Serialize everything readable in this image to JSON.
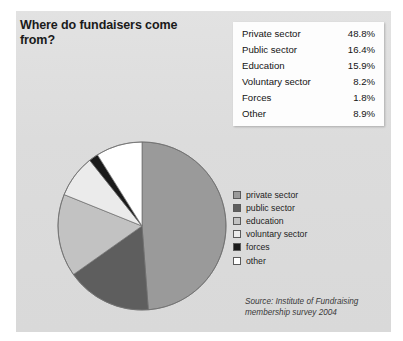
{
  "panel": {
    "background_color": "#dedede"
  },
  "title": "Where do fundaisers come from?",
  "table": {
    "rows": [
      {
        "label": "Private sector",
        "value": "48.8%"
      },
      {
        "label": "Public sector",
        "value": "16.4%"
      },
      {
        "label": "Education",
        "value": "15.9%"
      },
      {
        "label": "Voluntary sector",
        "value": "8.2%"
      },
      {
        "label": "Forces",
        "value": "1.8%"
      },
      {
        "label": "Other",
        "value": "8.9%"
      }
    ]
  },
  "legend": {
    "items": [
      {
        "label": "private sector",
        "color": "#9a9a9a"
      },
      {
        "label": "public sector",
        "color": "#5e5e5e"
      },
      {
        "label": "education",
        "color": "#c2c2c2"
      },
      {
        "label": "voluntary sector",
        "color": "#ebebeb"
      },
      {
        "label": "forces",
        "color": "#1a1a1a"
      },
      {
        "label": "other",
        "color": "#ffffff"
      }
    ]
  },
  "source": {
    "line1": "Source: Institute of Fundraising",
    "line2": "membership survey 2004"
  },
  "chart_data": {
    "type": "pie",
    "title": "Where do fundaisers come from?",
    "categories": [
      "private sector",
      "public sector",
      "education",
      "voluntary sector",
      "forces",
      "other"
    ],
    "values": [
      48.8,
      16.4,
      15.9,
      8.2,
      1.8,
      8.9
    ],
    "units": "percent",
    "colors": [
      "#9a9a9a",
      "#5e5e5e",
      "#c2c2c2",
      "#ebebeb",
      "#1a1a1a",
      "#ffffff"
    ],
    "start_angle_deg": 0,
    "direction": "clockwise",
    "legend_position": "right",
    "grid": false,
    "source_note": "Source: Institute of Fundraising membership survey 2004"
  }
}
